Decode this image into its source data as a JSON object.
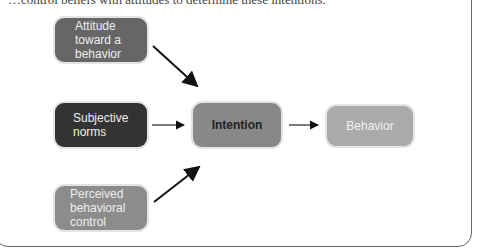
{
  "top_text": "…control beliefs with attitudes to determine these intentions.",
  "diagram": {
    "nodes": {
      "attitude": "Attitude toward a behavior",
      "subjective_norms": "Subjective norms",
      "perceived_control": "Perceived behavioral control",
      "intention": "Intention",
      "behavior": "Behavior"
    },
    "attitude_lines": [
      "Attitude",
      "toward a",
      "behavior"
    ],
    "subjective_lines": [
      "Subjective",
      "norms"
    ],
    "perceived_lines": [
      "Perceived",
      "behavioral",
      "control"
    ],
    "edges": [
      {
        "from": "attitude",
        "to": "intention"
      },
      {
        "from": "subjective_norms",
        "to": "intention"
      },
      {
        "from": "perceived_control",
        "to": "intention"
      },
      {
        "from": "intention",
        "to": "behavior"
      }
    ]
  }
}
